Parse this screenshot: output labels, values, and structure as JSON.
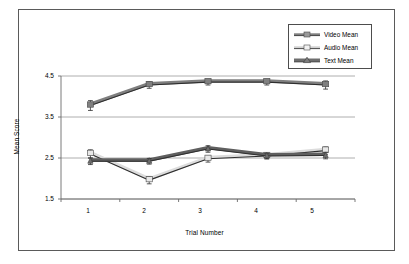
{
  "chart_data": {
    "type": "line",
    "title": "",
    "xlabel": "Trial Number",
    "ylabel": "Mean Score",
    "categories": [
      "1",
      "2",
      "3",
      "4",
      "5"
    ],
    "x": [
      1,
      2,
      3,
      4,
      5
    ],
    "xtick_labels": [
      "1",
      "2",
      "3",
      "4",
      "5"
    ],
    "ytick_labels": [
      "1.5",
      "2.5",
      "3.5",
      "4.5"
    ],
    "yticks": [
      1.5,
      2.5,
      3.5,
      4.5
    ],
    "ylim": [
      1.5,
      4.5
    ],
    "xlim": [
      0.5,
      5.5
    ],
    "grid": "horizontal",
    "legend_position": "top-right",
    "error_bars": true,
    "series": [
      {
        "name": "Video Mean",
        "label": "Video Mean",
        "marker": "square",
        "color": "#808080",
        "line_color": "#7f7f7f",
        "values": [
          3.78,
          4.28,
          4.35,
          4.35,
          4.28
        ],
        "errors": [
          0.12,
          0.08,
          0.07,
          0.07,
          0.1
        ]
      },
      {
        "name": "Audio Mean",
        "label": "Audio Mean",
        "marker": "square",
        "color": "#e8e8e8",
        "line_color": "#dcdcdc",
        "values": [
          2.6,
          1.96,
          2.48,
          2.55,
          2.68
        ],
        "errors": [
          0.1,
          0.09,
          0.08,
          0.07,
          0.09
        ]
      },
      {
        "name": "Text Mean",
        "label": "Text Mean",
        "marker": "triangle",
        "color": "#6e6e6e",
        "line_color": "#5f5f5f",
        "values": [
          2.42,
          2.42,
          2.72,
          2.55,
          2.56
        ],
        "errors": [
          0.08,
          0.07,
          0.08,
          0.07,
          0.08
        ]
      }
    ],
    "colors": {
      "axis": "#6b6b6b",
      "grid": "#9a9a9a",
      "frame": "#5a5a5a",
      "text": "#000000",
      "series_video": "#808080",
      "series_audio": "#e8e8e8",
      "series_text": "#6e6e6e"
    }
  }
}
